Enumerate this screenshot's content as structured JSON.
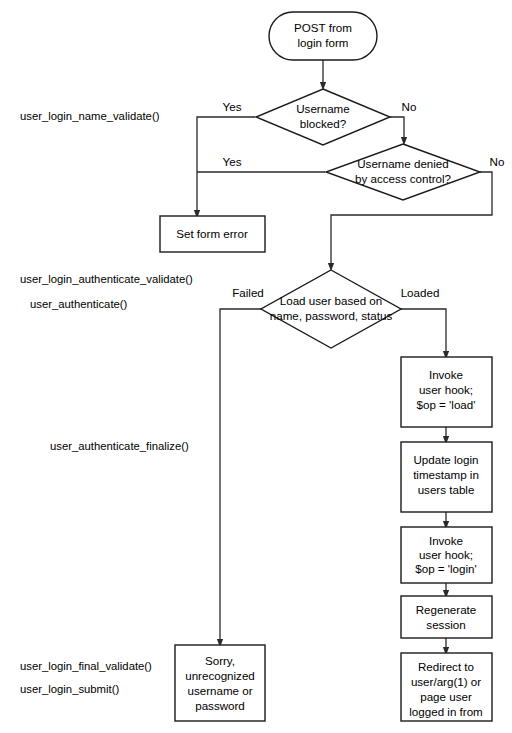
{
  "diagram": {
    "background_color": "#ffffff",
    "line_color": "#2a2a2a",
    "text_color": "#000000",
    "nodes": {
      "start": {
        "type": "terminator",
        "line1": "POST from",
        "line2": "login form"
      },
      "decision_blocked": {
        "type": "decision",
        "line1": "Username",
        "line2": "blocked?"
      },
      "decision_access": {
        "type": "decision",
        "line1": "Username denied",
        "line2": "by access control?"
      },
      "set_form_error": {
        "type": "process",
        "line1": "Set form error"
      },
      "decision_load": {
        "type": "decision",
        "line1": "Load user based on",
        "line2": "name, password, status"
      },
      "hook_load": {
        "type": "process",
        "line1": "Invoke",
        "line2": "user hook;",
        "line3": "$op = 'load'"
      },
      "update_login": {
        "type": "process",
        "line1": "Update login",
        "line2": "timestamp in",
        "line3": "users table"
      },
      "hook_login": {
        "type": "process",
        "line1": "Invoke",
        "line2": "user hook;",
        "line3": "$op = 'login'"
      },
      "regenerate_session": {
        "type": "process",
        "line1": "Regenerate",
        "line2": "session"
      },
      "redirect": {
        "type": "process",
        "line1": "Redirect to",
        "line2": "user/arg(1) or",
        "line3": "page user",
        "line4": "logged in from"
      },
      "sorry": {
        "type": "process",
        "line1": "Sorry,",
        "line2": "unrecognized",
        "line3": "username or",
        "line4": "password"
      }
    },
    "branch_labels": {
      "blocked_yes": "Yes",
      "blocked_no": "No",
      "access_yes": "Yes",
      "access_no": "No",
      "load_failed": "Failed",
      "load_loaded": "Loaded"
    },
    "api_labels": {
      "name_validate": "user_login_name_validate()",
      "authenticate_validate": "user_login_authenticate_validate()",
      "authenticate": "user_authenticate()",
      "authenticate_finalize": "user_authenticate_finalize()",
      "final_validate": "user_login_final_validate()",
      "login_submit": "user_login_submit()"
    }
  }
}
